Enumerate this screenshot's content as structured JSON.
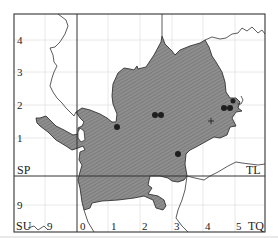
{
  "map": {
    "grid_squares": {
      "top_left": "SP",
      "top_right": "TL",
      "bottom_left": "SU",
      "bottom_right": "TQ"
    },
    "y_ticks_left": [
      "4",
      "3",
      "2",
      "1",
      "9"
    ],
    "x_ticks_bottom": [
      "9",
      "0",
      "1",
      "2",
      "3",
      "4",
      "5"
    ],
    "colors": {
      "fill": "#8c8c8c",
      "hatch": "#6f6f6f",
      "line": "#333333",
      "grid": "#dcdcdc",
      "dot": "#222222"
    },
    "records": {
      "dots": [
        {
          "x": 117,
          "y": 127
        },
        {
          "x": 155,
          "y": 115
        },
        {
          "x": 161,
          "y": 115
        },
        {
          "x": 178,
          "y": 154
        },
        {
          "x": 224,
          "y": 108
        },
        {
          "x": 230,
          "y": 108
        },
        {
          "x": 233,
          "y": 101
        }
      ],
      "crosses": [
        {
          "x": 211,
          "y": 121
        }
      ]
    }
  }
}
